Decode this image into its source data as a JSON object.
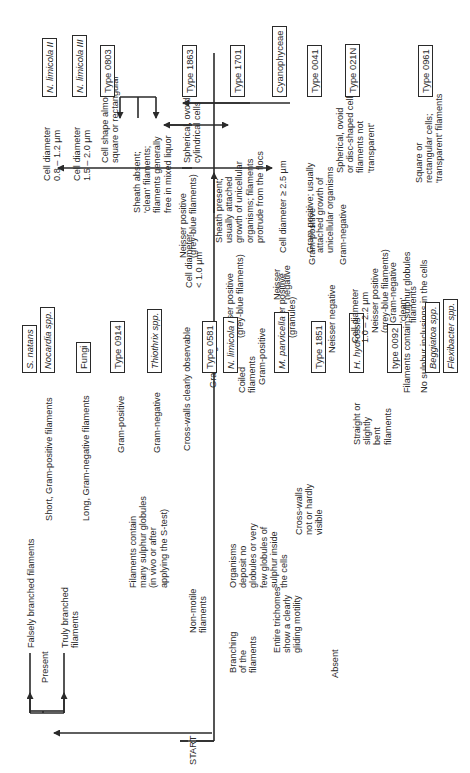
{
  "diagram": {
    "type": "flowchart",
    "orientation": "rotated 90deg counter-clockwise (reads bottom-to-top)",
    "colors": {
      "ink": "#2a2a2a",
      "background": "#ffffff"
    }
  },
  "nodes": {
    "start": "START",
    "branching": "Branching\nof the\nfilaments",
    "present": "Present",
    "absent": "Absent",
    "falsely_branched": "Falsely branched filaments",
    "truly_branched": "Truly branched\nfilaments",
    "short_gram_pos": "Short, Gram-positive filaments",
    "long_gram_neg": "Long, Gram-negative filaments",
    "non_motile": "Non-motile\nfilaments",
    "gliding": "Entire trichomes\nshow a clearly\ngliding motility",
    "sulphur_globules_many": "Filaments contain\nmany sulphur globules\n(in vivo or after\napplying the S-test)",
    "organisms_no_globules": "Organisms\ndeposit no\nglobules or very\nfew globules of\nsulphur inside\nthe cells",
    "gram_pos_1": "Gram-positive",
    "gram_neg_1": "Gram-negative",
    "cross_walls_clear": "Cross-walls clearly observable",
    "cross_walls_not": "Cross-walls\nnot or hardly\nvisible",
    "coiled": "Coiled\nfilaments",
    "straight": "Straight or\nslightly\nbent\nfilaments",
    "coiled_gram_neg": "Gram-negative",
    "coiled_gram_pos": "Gram-positive",
    "coiled_neisser_pos_grey": "Neisser positive\n(grey-blue filaments)",
    "coiled_neisser_pos_granules": "Neisser positive\n(granules)",
    "straight_neisser_neg": "Neisser negative",
    "straight_neisser_pos": "Neisser positive\n(grey-blue filaments)",
    "straight_gram_pos": "Gram-positive",
    "straight_gram_neg": "Gram-negative",
    "filaments_contain_sulphur": "Filaments contain sulphur globules",
    "no_sulphur": "No sulphur inclusions in the cells",
    "neisser_pos_main": "Neisser positive\n(grey-blue filaments)",
    "neisser_neg_main": "Neisser\nnegative",
    "np_cell_08": "Cell diameter\n0.8 – 1.2 µm",
    "np_cell_15": "Cell diameter\n1.5 – 2.0 µm",
    "cell_lt_1": "Cell diameter\n< 1.0 µm",
    "cell_ge_25": "Cell diameter ≥ 2.5 µm",
    "cell_10_22": "Cell diameter\n1.0 – 2.2 µm",
    "sheath_absent": "Sheath absent;\n'clean' filaments;\nfilaments generally\nfree in mixed liquor",
    "sheath_present": "Sheath present;\nusually attached\ngrowth of unicellular\norganisms; filaments\nprotrude from the flocs",
    "cell_shape_square": "Cell shape almost\nsquare or rectangular",
    "spherical_ovoid_cyl": "Spherical, ovoid or\ncylindrical cells",
    "gram_pos_attached": "Gram positive; usually\nattached growth of\nunicellular organisms",
    "gram_neg_clean": "Gram-negative\n'clean'\nfilaments",
    "spherical_disc": "Spherical, ovoid\nor disc-shaped cells\nfilaments not\n'transparent'",
    "square_transparent": "Square or\nrectangular cells;\n'transparent' filaments"
  },
  "leaves": {
    "s_natans": "S. natans",
    "nocardia": "Nocardia spp.",
    "fungi": "Fungi",
    "type_0914": "Type 0914",
    "thiothrix": "Thiothrix spp.",
    "type_0581": "Type 0581",
    "n_limicola_1": "N. limicola I",
    "m_parvicella": "M. parvicella",
    "type_1851": "Type 1851",
    "h_hydrossis": "H. hydrossis",
    "type_0092": "type 0092",
    "beggiatoa": "Beggiatoa spp.",
    "flexibacter": "Flexibacter spp.",
    "n_limicola_2": "N. limicola II",
    "n_limicola_3": "N. limicola III",
    "type_0803": "Type 0803",
    "type_1863": "Type 1863",
    "type_1701": "Type 1701",
    "cyanophyceae": "Cyanophyceae",
    "type_0041": "Type 0041",
    "type_021n": "Type 021N",
    "type_0961": "Type 0961"
  }
}
